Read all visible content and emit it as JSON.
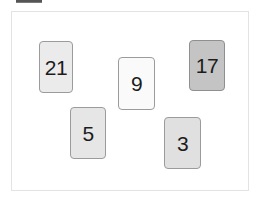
{
  "window": {
    "title": "Card Sort Puzzle",
    "background_color": "#ffffff"
  },
  "top_clipped_bar": {
    "name": "clipped-toolbar-strip",
    "color": "#555555"
  },
  "board": {
    "label": "Card arrangement area",
    "border_color": "#e3e3e3",
    "background_color": "#ffffff",
    "x": 11,
    "y": 11,
    "width": 238,
    "height": 180
  },
  "cards": [
    {
      "value": "21",
      "name": "card-21",
      "x": 27,
      "y": 29,
      "width": 34,
      "height": 52,
      "fill": "#ebebeb",
      "border": "#9b9b9b",
      "text_color": "#1c1c1c"
    },
    {
      "value": "9",
      "name": "card-9",
      "x": 106,
      "y": 45,
      "width": 37,
      "height": 53,
      "fill": "#fafafa",
      "border": "#9b9b9b",
      "text_color": "#1c1c1c"
    },
    {
      "value": "17",
      "name": "card-17",
      "x": 177,
      "y": 28,
      "width": 36,
      "height": 51,
      "fill": "#c4c4c4",
      "border": "#8f8f8f",
      "text_color": "#1c1c1c"
    },
    {
      "value": "5",
      "name": "card-5",
      "x": 58,
      "y": 95,
      "width": 36,
      "height": 52,
      "fill": "#e6e6e6",
      "border": "#9b9b9b",
      "text_color": "#1c1c1c"
    },
    {
      "value": "3",
      "name": "card-3",
      "x": 152,
      "y": 105,
      "width": 37,
      "height": 52,
      "fill": "#e0e0e0",
      "border": "#9b9b9b",
      "text_color": "#1c1c1c"
    }
  ]
}
